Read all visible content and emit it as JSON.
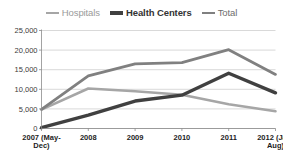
{
  "legend": {
    "position": "top-center",
    "entries": [
      {
        "name": "hospitals",
        "label": "Hospitals",
        "color": "#a6a6a6",
        "width": 2.6
      },
      {
        "name": "health-centers",
        "label": "Health Centers",
        "color": "#404040",
        "width": 3.4
      },
      {
        "name": "total",
        "label": "Total",
        "color": "#808080",
        "width": 2.8
      }
    ]
  },
  "axes": {
    "y_ticks": [
      "0",
      "5,000",
      "10,000",
      "15,000",
      "20,000",
      "25,000"
    ],
    "x_ticks": [
      "2007 (May-Dec)",
      "2008",
      "2009",
      "2010",
      "2011",
      "2012 (Jan-Aug)"
    ]
  },
  "chart_data": {
    "type": "line",
    "title": "",
    "subtitle": "",
    "xlabel": "",
    "ylabel": "",
    "categories": [
      "2007 (May-Dec)",
      "2008",
      "2009",
      "2010",
      "2011",
      "2012 (Jan-Aug)"
    ],
    "series": [
      {
        "name": "Hospitals",
        "color": "#a6a6a6",
        "values": [
          4800,
          10200,
          9500,
          8600,
          6200,
          4400
        ]
      },
      {
        "name": "Health Centers",
        "color": "#404040",
        "values": [
          200,
          3400,
          7000,
          8500,
          14100,
          9100
        ]
      },
      {
        "name": "Total",
        "color": "#808080",
        "values": [
          4900,
          13400,
          16500,
          16800,
          20100,
          13800
        ]
      }
    ],
    "ylim": [
      0,
      25000
    ],
    "ytick_step": 5000,
    "grid": true,
    "legend_position": "top"
  }
}
